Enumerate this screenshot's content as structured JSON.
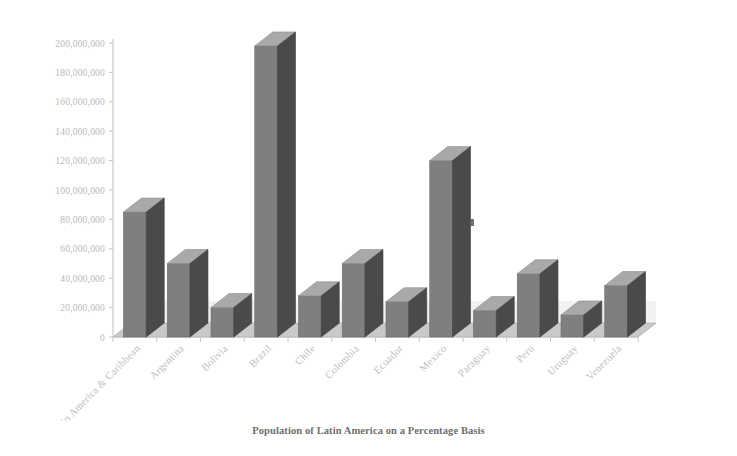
{
  "caption": "Population of Latin America on a Percentage Basis",
  "colors": {
    "bar_front": "#7f7f7f",
    "bar_side": "#4a4a4a",
    "bar_top": "#a9a9a9",
    "floor": "#c9c9c9",
    "floor_edge": "#b0b0b0",
    "axis": "#c4c4c4",
    "tick_text": "#b9b9b9",
    "caption_text": "#6e6e6e"
  },
  "chart_data": {
    "type": "bar",
    "title": "",
    "subtitle": "",
    "xlabel": "",
    "ylabel": "",
    "ylim": [
      0,
      200000000
    ],
    "ytick_step": 20000000,
    "grid": false,
    "legend": "none",
    "three_d": true,
    "categories": [
      "Latin America & Caribbean",
      "Argentina",
      "Bolivia",
      "Brazil",
      "Chile",
      "Colombia",
      "Ecuador",
      "Mexico",
      "Paraguay",
      "Peru",
      "Uruguay",
      "Venezuela"
    ],
    "values": [
      85000000,
      50000000,
      20000000,
      198000000,
      28000000,
      50000000,
      24000000,
      120000000,
      18000000,
      43000000,
      15000000,
      35000000
    ],
    "ytick_labels": [
      "200,000,000",
      "180,000,000",
      "160,000,000",
      "140,000,000",
      "120,000,000",
      "100,000,000",
      "80,000,000",
      "60,000,000",
      "40,000,000",
      "20,000,000",
      "0"
    ],
    "ytick_values": [
      200000000,
      180000000,
      160000000,
      140000000,
      120000000,
      100000000,
      80000000,
      60000000,
      40000000,
      20000000,
      0
    ]
  }
}
